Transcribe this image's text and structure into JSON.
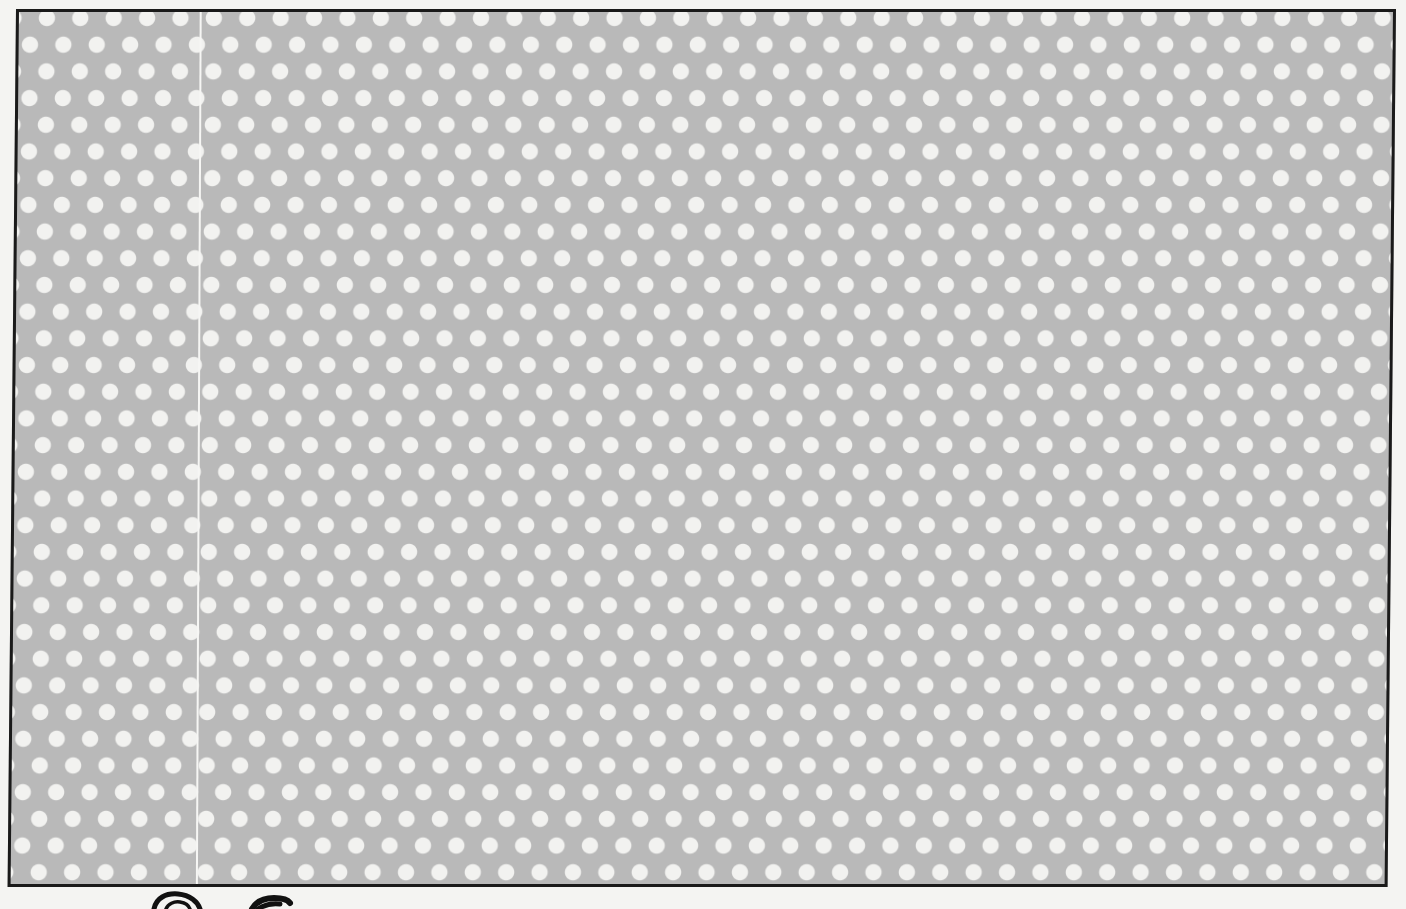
{
  "page": {
    "panel": {
      "fill_color": "#b9b9b9",
      "dot_color": "#f2f2f0",
      "border_color": "#1a1a1a",
      "dot_diameter_px": 16,
      "dot_pitch_x_px": 33,
      "dot_row_spacing_px": 27,
      "pattern": "staggered"
    },
    "seam": {
      "color": "#f6f6f4",
      "position_x_px": 200
    },
    "drawing": {
      "description": "partial black line drawing cut off at bottom edge",
      "stroke_color": "#111111"
    }
  }
}
